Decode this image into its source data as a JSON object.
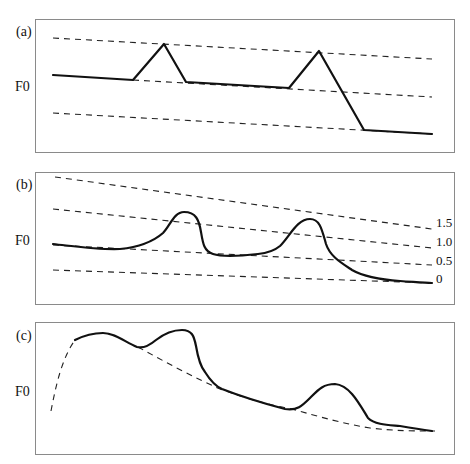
{
  "figure": {
    "panels": [
      {
        "label": "(a)",
        "y_axis_label": "F0",
        "description": "Linear (straight-line) F0 model: declining topline, midline and baseline with triangular pitch accents",
        "reference_lines": [
          {
            "name": "topline",
            "style": "dashed",
            "points": [
              [
                53,
                38
              ],
              [
                432,
                59
              ]
            ]
          },
          {
            "name": "midline",
            "style": "dashed",
            "points": [
              [
                133,
                80
              ],
              [
                432,
                97
              ]
            ]
          },
          {
            "name": "baseline",
            "style": "dashed",
            "points": [
              [
                53,
                113
              ],
              [
                432,
                134
              ]
            ]
          }
        ],
        "contour": {
          "style": "solid",
          "points": [
            [
              53,
              75
            ],
            [
              133,
              80
            ],
            [
              164,
              44
            ],
            [
              186,
              82
            ],
            [
              289,
              88
            ],
            [
              319,
              51
            ],
            [
              364,
              130
            ],
            [
              432,
              134
            ]
          ]
        }
      },
      {
        "label": "(b)",
        "y_axis_label": "F0",
        "description": "Smooth F0 contour with declining reference lines at relative levels",
        "level_labels": [
          "1.5",
          "1.0",
          "0.5",
          "0"
        ],
        "reference_lines": [
          {
            "level": "1.5",
            "style": "dashed",
            "points": [
              [
                55,
                177
              ],
              [
                432,
                229
              ]
            ]
          },
          {
            "level": "1.0",
            "style": "dashed",
            "points": [
              [
                53,
                209
              ],
              [
                432,
                248
              ]
            ]
          },
          {
            "level": "0.5",
            "style": "dashed",
            "points": [
              [
                53,
                245
              ],
              [
                432,
                265
              ]
            ]
          },
          {
            "level": "0",
            "style": "dashed",
            "points": [
              [
                53,
                270
              ],
              [
                432,
                283
              ]
            ]
          }
        ],
        "contour": {
          "style": "solid"
        }
      },
      {
        "label": "(c)",
        "y_axis_label": "F0",
        "description": "Smooth F0 contour with phrase component (dashed) and accent humps",
        "phrase_component": {
          "style": "dashed"
        },
        "contour": {
          "style": "solid"
        }
      }
    ]
  }
}
